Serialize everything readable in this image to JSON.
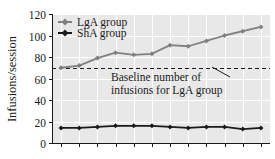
{
  "chart_data": {
    "type": "line",
    "title": "",
    "subtitle": "",
    "xlabel": "",
    "ylabel": "Infusions/session",
    "xlim": [
      0.5,
      12.5
    ],
    "ylim": [
      0,
      120
    ],
    "grid": true,
    "y_ticks": [
      0,
      20,
      40,
      60,
      80,
      100,
      120
    ],
    "y_tick_labels": [
      "0",
      "20",
      "40",
      "60",
      "80",
      "100",
      "120"
    ],
    "x_ticks": [
      1,
      2,
      3,
      4,
      5,
      6,
      7,
      8,
      9,
      10,
      11,
      12
    ],
    "x_tick_labels": [
      "",
      "",
      "",
      "",
      "",
      "",
      "",
      "",
      "",
      "",
      "",
      ""
    ],
    "legend_position": "upper left",
    "x": [
      1,
      2,
      3,
      4,
      5,
      6,
      7,
      8,
      9,
      10,
      11,
      12
    ],
    "series": [
      {
        "name": "LgA group",
        "color": "#808080",
        "marker": "diamond",
        "values": [
          70,
          72,
          79,
          84,
          82,
          83,
          91,
          90,
          95,
          100,
          104,
          108
        ]
      },
      {
        "name": "ShA group",
        "color": "#1a1a1a",
        "marker": "diamond",
        "values": [
          14,
          14,
          15,
          16,
          16,
          16,
          15,
          14,
          15,
          15,
          13,
          14
        ]
      }
    ],
    "reference_lines": [
      {
        "name": "baseline",
        "orientation": "horizontal",
        "value": 70,
        "style": "dashed",
        "color": "#1a1a1a"
      }
    ],
    "annotations": [
      {
        "name": "baseline-annotation",
        "line1": "Baseline number of",
        "line2": "infusions for LgA group",
        "points_to": 70
      }
    ]
  },
  "legend": {
    "items": [
      {
        "label": "LgA group",
        "color": "#808080"
      },
      {
        "label": "ShA group",
        "color": "#1a1a1a"
      }
    ]
  },
  "axes": {
    "y_title": "Infusions/session"
  },
  "colors": {
    "plot_background": "#e8e8e8",
    "gridline": "#ffffff",
    "axis": "#1a1a1a",
    "lga": "#808080",
    "sha": "#1a1a1a",
    "figure_background": "#ffffff"
  }
}
